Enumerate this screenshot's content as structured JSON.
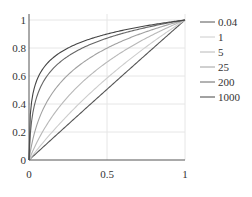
{
  "chart_data": {
    "type": "line",
    "title": "",
    "xlabel": "",
    "ylabel": "",
    "xlim": [
      0,
      1
    ],
    "ylim": [
      0,
      1
    ],
    "grid": true,
    "legend_position": "right",
    "x_ticks": [
      "0",
      "0.5",
      "1"
    ],
    "y_ticks": [
      "0",
      "0.2",
      "0.4",
      "0.6",
      "0.8",
      "1"
    ],
    "x": [
      0,
      0.1,
      0.2,
      0.3,
      0.4,
      0.5,
      0.6,
      0.7,
      0.8,
      0.9,
      1.0
    ],
    "series": [
      {
        "name": "0.04",
        "param": 0.04,
        "color": "#555555",
        "values": [
          0,
          0.102,
          0.204,
          0.305,
          0.406,
          0.506,
          0.606,
          0.705,
          0.804,
          0.902,
          1.0
        ]
      },
      {
        "name": "1",
        "param": 1,
        "color": "#cccccc",
        "values": [
          0,
          0.138,
          0.263,
          0.379,
          0.485,
          0.585,
          0.678,
          0.766,
          0.848,
          0.926,
          1.0
        ]
      },
      {
        "name": "5",
        "param": 5,
        "color": "#b8b8b8",
        "values": [
          0,
          0.226,
          0.387,
          0.512,
          0.613,
          0.699,
          0.774,
          0.839,
          0.898,
          0.951,
          1.0
        ]
      },
      {
        "name": "25",
        "param": 25,
        "color": "#a0a0a0",
        "values": [
          0,
          0.385,
          0.55,
          0.653,
          0.727,
          0.785,
          0.833,
          0.873,
          0.908,
          0.94,
          1.0
        ]
      },
      {
        "name": "200",
        "param": 200,
        "color": "#666666",
        "values": [
          0,
          0.575,
          0.709,
          0.78,
          0.829,
          0.87,
          0.901,
          0.925,
          0.945,
          0.963,
          1.0
        ]
      },
      {
        "name": "1000",
        "param": 1000,
        "color": "#444444",
        "values": [
          0,
          0.669,
          0.768,
          0.827,
          0.868,
          0.9,
          0.926,
          0.948,
          0.966,
          0.983,
          1.0
        ]
      }
    ],
    "formula_hint": "y = ln(1 + a·x) / ln(1 + a)"
  },
  "axes": {
    "x_tick_labels": [
      "0",
      "0.5",
      "1"
    ],
    "y_tick_labels": [
      "0",
      "0.2",
      "0.4",
      "0.6",
      "0.8",
      "1"
    ]
  },
  "legend": {
    "entries": [
      "0.04",
      "1",
      "5",
      "25",
      "200",
      "1000"
    ]
  }
}
